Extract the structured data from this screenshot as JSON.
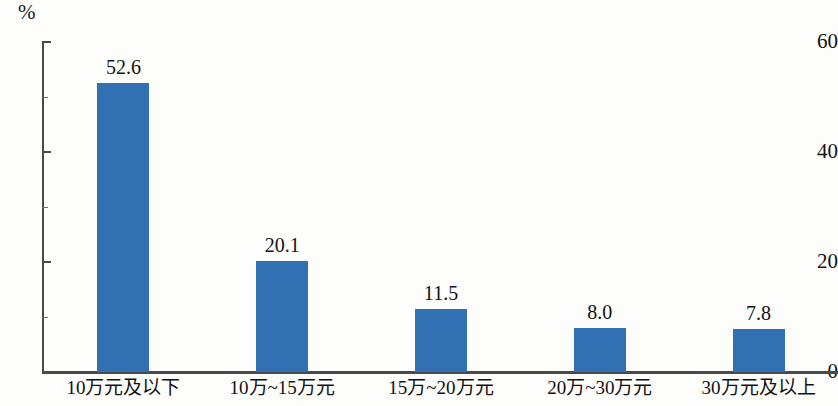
{
  "chart_data": {
    "type": "bar",
    "title": "",
    "subtitle": "",
    "xlabel": "",
    "ylabel": "",
    "unit_label": "%",
    "categories": [
      "10万元及以下",
      "10万~15万元",
      "15万~20万元",
      "20万~30万元",
      "30万元及以上"
    ],
    "values": [
      52.6,
      20.1,
      11.5,
      8.0,
      7.8
    ],
    "value_labels": [
      "52.6",
      "20.1",
      "11.5",
      "8.0",
      "7.8"
    ],
    "ylim": [
      0,
      60
    ],
    "yticks": [
      0,
      20,
      40,
      60
    ],
    "ytick_labels": [
      "0",
      "20",
      "40",
      "60"
    ],
    "yticks_minor": [
      10,
      30,
      50
    ],
    "grid": false,
    "legend": null,
    "series": [
      {
        "name": "占比",
        "values": [
          52.6,
          20.1,
          11.5,
          8.0,
          7.8
        ]
      }
    ],
    "colors": {
      "bar": "#3070b3",
      "axis": "#4a4a4a",
      "text": "#111111",
      "background": "#fdfdfc"
    }
  }
}
